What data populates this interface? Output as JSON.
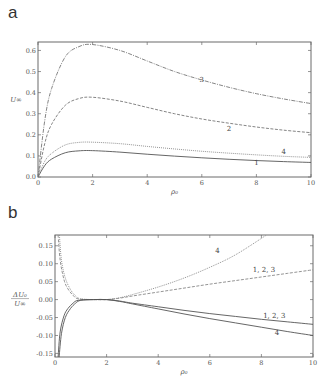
{
  "chart_data": [
    {
      "panel_label": "a",
      "type": "line",
      "title": "",
      "xlabel": "ρ₀",
      "ylabel": "U∞",
      "xlim": [
        0,
        10
      ],
      "ylim": [
        0,
        0.64
      ],
      "grid": false,
      "x_ticks": [
        "0",
        "2",
        "4",
        "6",
        "8",
        "10"
      ],
      "y_ticks": [
        "0.0",
        "0.1",
        "0.2",
        "0.3",
        "0.4",
        "0.5",
        "0.6"
      ],
      "x": [
        0,
        0.25,
        0.5,
        1,
        1.5,
        2,
        3,
        4,
        5,
        6,
        7,
        8,
        9,
        10
      ],
      "series": [
        {
          "name": "1",
          "style": "solid",
          "color": "#555555",
          "label_at": [
            8,
            0.055
          ],
          "values": [
            0,
            0.055,
            0.085,
            0.115,
            0.124,
            0.125,
            0.118,
            0.108,
            0.099,
            0.091,
            0.084,
            0.078,
            0.073,
            0.069
          ]
        },
        {
          "name": "4",
          "style": "dotted",
          "color": "#888888",
          "label_at": [
            9,
            0.107
          ],
          "values": [
            0,
            0.075,
            0.112,
            0.152,
            0.164,
            0.165,
            0.158,
            0.145,
            0.133,
            0.122,
            0.113,
            0.105,
            0.098,
            0.093
          ]
        },
        {
          "name": "2",
          "style": "dashed",
          "color": "#777777",
          "label_at": [
            7,
            0.22
          ],
          "values": [
            0,
            0.16,
            0.25,
            0.34,
            0.372,
            0.378,
            0.36,
            0.33,
            0.3,
            0.275,
            0.255,
            0.237,
            0.222,
            0.21
          ]
        },
        {
          "name": "3",
          "style": "dashdot",
          "color": "#777777",
          "label_at": [
            6,
            0.45
          ],
          "values": [
            0,
            0.27,
            0.42,
            0.57,
            0.618,
            0.628,
            0.6,
            0.55,
            0.5,
            0.46,
            0.425,
            0.395,
            0.37,
            0.348
          ]
        }
      ]
    },
    {
      "panel_label": "b",
      "type": "line",
      "title": "",
      "xlabel": "ρ₀",
      "ylabel_num": "ΔU₀",
      "ylabel_den": "U∞",
      "xlim": [
        0,
        10
      ],
      "ylim": [
        -0.16,
        0.18
      ],
      "grid": false,
      "x_ticks": [
        "0",
        "2",
        "4",
        "6",
        "8",
        "10"
      ],
      "y_ticks": [
        "-0.15",
        "-0.10",
        "-0.05",
        "0.00",
        "0.05",
        "0.10",
        "0.15"
      ],
      "series": [
        {
          "name": "4",
          "style": "dotted",
          "color": "#888888",
          "label_at": [
            6.3,
            0.13
          ],
          "x": [
            0.17,
            0.25,
            0.4,
            0.6,
            0.8,
            1,
            1.5,
            2,
            2.5,
            3,
            4,
            5,
            6,
            7,
            8.2
          ],
          "values": [
            0.18,
            0.11,
            0.06,
            0.028,
            0.01,
            0.002,
            0.0,
            0.0,
            0.005,
            0.014,
            0.035,
            0.06,
            0.09,
            0.125,
            0.18
          ]
        },
        {
          "name": "1, 2, 3",
          "style": "dashed",
          "color": "#888888",
          "label_at": [
            8.1,
            0.077
          ],
          "x": [
            0.12,
            0.2,
            0.35,
            0.5,
            0.7,
            0.9,
            1.5,
            2,
            2.5,
            3,
            4,
            5,
            6,
            7,
            8,
            9,
            10
          ],
          "values": [
            0.18,
            0.11,
            0.055,
            0.03,
            0.012,
            0.002,
            0.0,
            0.0,
            0.004,
            0.01,
            0.021,
            0.032,
            0.043,
            0.053,
            0.063,
            0.073,
            0.083
          ]
        },
        {
          "name": "1, 2, 3",
          "style": "solid",
          "color": "#555555",
          "label_at": [
            8.5,
            -0.052
          ],
          "x": [
            0.12,
            0.2,
            0.35,
            0.5,
            0.7,
            0.9,
            1.5,
            2,
            2.5,
            3,
            4,
            5,
            6,
            7,
            8,
            9,
            10
          ],
          "values": [
            -0.16,
            -0.09,
            -0.045,
            -0.025,
            -0.01,
            -0.002,
            0.0,
            0.0,
            -0.004,
            -0.01,
            -0.02,
            -0.03,
            -0.039,
            -0.047,
            -0.055,
            -0.062,
            -0.069
          ]
        },
        {
          "name": "4",
          "style": "solid",
          "color": "#555555",
          "label_at": [
            8.6,
            -0.1
          ],
          "x": [
            0.16,
            0.25,
            0.4,
            0.6,
            0.8,
            1,
            1.5,
            2,
            2.5,
            3,
            4,
            5,
            6,
            7,
            8,
            9,
            10
          ],
          "values": [
            -0.16,
            -0.095,
            -0.05,
            -0.025,
            -0.01,
            -0.002,
            0.0,
            0.0,
            -0.005,
            -0.012,
            -0.026,
            -0.04,
            -0.053,
            -0.065,
            -0.077,
            -0.089,
            -0.1
          ]
        }
      ]
    }
  ]
}
